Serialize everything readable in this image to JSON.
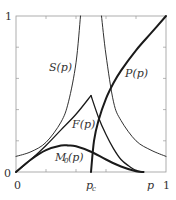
{
  "figure": {
    "axes": {
      "x_min_label": "0",
      "x_max_label": "1",
      "x_axis_label": "p",
      "y_min_label": "0",
      "y_max_label": "1",
      "critical_label": "p",
      "critical_subscript": "c"
    },
    "curve_labels": {
      "S": "S(p)",
      "F": "F(p)",
      "M0": "M",
      "M0_sub": "0",
      "M0_tail": "(p)",
      "P": "P(p)"
    }
  },
  "chart_data": {
    "type": "line",
    "title": "",
    "xlabel": "p",
    "ylabel": "",
    "xlim": [
      0,
      1
    ],
    "ylim": [
      0,
      1
    ],
    "grid": false,
    "annotations": [
      "p_c ≈ 0.5 (critical point)"
    ],
    "x_ticks": [
      0,
      0.2,
      0.4,
      0.6,
      0.8,
      1
    ],
    "y_ticks": [
      0,
      0.2,
      0.4,
      0.6,
      0.8,
      1
    ],
    "series": [
      {
        "name": "S(p)",
        "style": "thin",
        "note": "diverges at p_c",
        "x": [
          0,
          0.1,
          0.2,
          0.3,
          0.35,
          0.4,
          0.43,
          0.57,
          0.6,
          0.65,
          0.7,
          0.8,
          0.9,
          1.0
        ],
        "values": [
          0.1,
          0.13,
          0.19,
          0.32,
          0.45,
          0.7,
          1.0,
          1.0,
          0.75,
          0.45,
          0.33,
          0.2,
          0.14,
          0.1
        ]
      },
      {
        "name": "F(p)",
        "style": "medium",
        "x": [
          0,
          0.1,
          0.2,
          0.3,
          0.4,
          0.5,
          0.55,
          0.6,
          0.65,
          0.7,
          0.75,
          0.8,
          0.85
        ],
        "values": [
          0,
          0.08,
          0.17,
          0.27,
          0.37,
          0.49,
          0.35,
          0.24,
          0.15,
          0.08,
          0.04,
          0.01,
          0
        ]
      },
      {
        "name": "M0(p)",
        "style": "thick",
        "x": [
          0,
          0.1,
          0.2,
          0.3,
          0.35,
          0.4,
          0.5,
          0.6,
          0.7,
          0.8,
          0.85
        ],
        "values": [
          0,
          0.08,
          0.14,
          0.17,
          0.17,
          0.165,
          0.13,
          0.08,
          0.035,
          0.005,
          0
        ]
      },
      {
        "name": "P(p)",
        "style": "thick",
        "x": [
          0.5,
          0.52,
          0.55,
          0.6,
          0.65,
          0.7,
          0.8,
          0.9,
          1.0
        ],
        "values": [
          0,
          0.2,
          0.33,
          0.47,
          0.57,
          0.65,
          0.78,
          0.89,
          1.0
        ]
      }
    ]
  }
}
